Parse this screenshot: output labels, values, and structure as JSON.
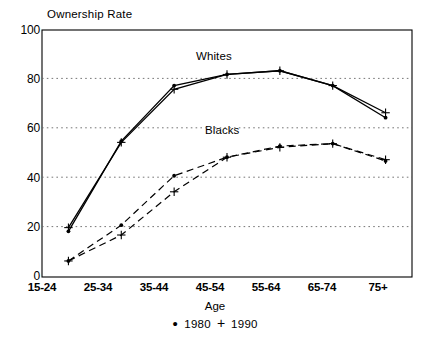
{
  "chart_data": {
    "type": "line",
    "title": "",
    "ylabel": "Ownership Rate",
    "xlabel": "Age",
    "categories": [
      "15-24",
      "25-34",
      "35-44",
      "45-54",
      "55-64",
      "65-74",
      "75+"
    ],
    "ylim": [
      0,
      100
    ],
    "yticks": [
      0,
      20,
      40,
      60,
      80,
      100
    ],
    "grid": "horizontal-dotted",
    "legend": {
      "position": "bottom-center",
      "entries": [
        {
          "label": "1980",
          "marker": "dot"
        },
        {
          "label": "1990",
          "marker": "plus"
        }
      ]
    },
    "annotations": [
      {
        "text": "Whites",
        "x_category": "45-54",
        "y": 90
      },
      {
        "text": "Blacks",
        "x_category": "45-54",
        "y": 59
      }
    ],
    "series": [
      {
        "name": "Whites",
        "year": "1980",
        "marker": "dot",
        "linestyle": "solid",
        "values": [
          18.5,
          55.0,
          77.5,
          82.0,
          83.5,
          77.5,
          64.5
        ]
      },
      {
        "name": "Whites",
        "year": "1990",
        "marker": "plus",
        "linestyle": "solid",
        "values": [
          20.0,
          54.5,
          76.0,
          82.0,
          83.5,
          77.5,
          66.5
        ]
      },
      {
        "name": "Blacks",
        "year": "1980",
        "marker": "dot",
        "linestyle": "dashed",
        "values": [
          6.5,
          21.0,
          41.0,
          48.5,
          53.0,
          54.0,
          47.0
        ]
      },
      {
        "name": "Blacks",
        "year": "1990",
        "marker": "plus",
        "linestyle": "dashed",
        "values": [
          6.5,
          17.0,
          34.5,
          48.5,
          52.5,
          54.0,
          47.5
        ]
      }
    ]
  },
  "labels": {
    "y_axis_title": "Ownership Rate",
    "x_axis_title": "Age",
    "whites": "Whites",
    "blacks": "Blacks",
    "legend_1980": "1980",
    "legend_1990": "1990",
    "y_0": "0",
    "y_20": "20",
    "y_40": "40",
    "y_60": "60",
    "y_80": "80",
    "y_100": "100",
    "x_1": "15-24",
    "x_2": "25-34",
    "x_3": "35-44",
    "x_4": "45-54",
    "x_5": "55-64",
    "x_6": "65-74",
    "x_7": "75+"
  },
  "colors": {
    "ink": "#000000",
    "grid": "#555555",
    "background": "#ffffff"
  }
}
